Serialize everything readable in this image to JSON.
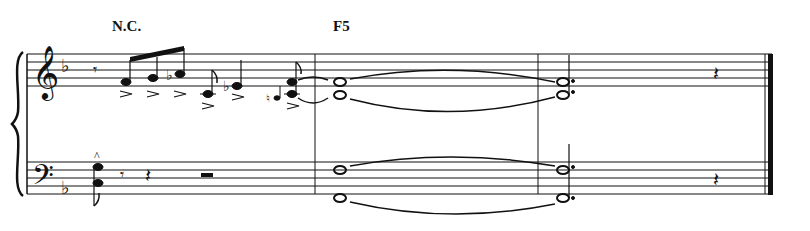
{
  "score": {
    "chord_symbols": [
      {
        "label": "N.C.",
        "x": 112,
        "y": 33
      },
      {
        "label": "F5",
        "x": 333,
        "y": 33
      }
    ],
    "key_signature": "F major (1 flat)",
    "staves": [
      "treble",
      "bass"
    ],
    "measures": 3,
    "colors": {
      "ink": "#111111",
      "background": "#ffffff"
    },
    "treble": {
      "measure_1": [
        "eighth rest",
        "F4 accent",
        "G4 accent",
        "Ab4 accent",
        "C4 accent eighth",
        "Eb4 accent quarter",
        "grace B3/C4",
        "C4+F4 eighth accent tied"
      ],
      "measure_2": [
        "C4+F4 whole tied"
      ],
      "measure_3": [
        "C4+F4 dotted half",
        "quarter rest"
      ]
    },
    "bass": {
      "measure_1": [
        "Bb2+F3 eighth marcato",
        "eighth rest",
        "quarter rest",
        "half rest"
      ],
      "measure_2": [
        "F2+F3 whole tied"
      ],
      "measure_3": [
        "F2+F3 dotted half",
        "quarter rest"
      ]
    }
  }
}
